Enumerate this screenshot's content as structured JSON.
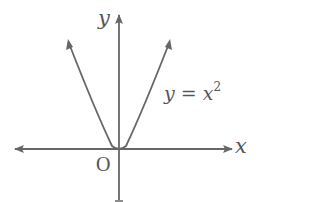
{
  "diagram": {
    "type": "function-graph",
    "function": "y = x^2",
    "axes": {
      "x_label": "x",
      "y_label": "y",
      "origin_label": "O"
    },
    "curve_label": {
      "lhs": "y",
      "equals": "=",
      "base": "x",
      "exponent": "2"
    },
    "colors": {
      "stroke": "#666666",
      "text": "#555555",
      "background": "#ffffff"
    }
  }
}
